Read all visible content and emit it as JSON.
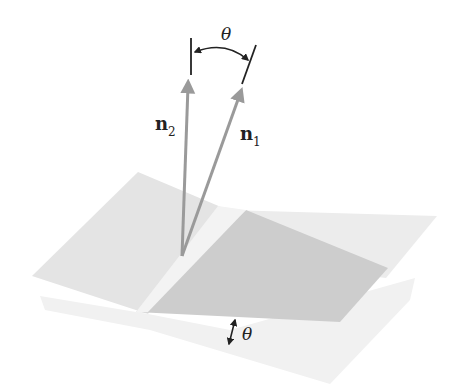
{
  "figure": {
    "labels": {
      "top_angle": "θ",
      "normal_1": "n",
      "normal_1_sub": "1",
      "normal_2": "n",
      "normal_2_sub": "2",
      "plane_angle": "θ"
    },
    "colors": {
      "background": "#ffffff",
      "light_plane": "#e6e6e6",
      "light_plane_far": "#efefef",
      "dark_plane": "#cfcfcf",
      "arrow": "#9a9a9a",
      "ink": "#222222"
    }
  }
}
